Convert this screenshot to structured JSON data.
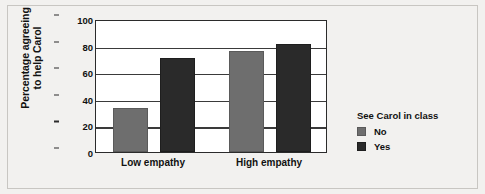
{
  "chart_data": {
    "type": "bar",
    "title": "",
    "subtitle": "",
    "xlabel": "",
    "ylabel": "Percentage agreeing to help Carol",
    "ylabel_lines": [
      "Percentage agreeing",
      "to help Carol"
    ],
    "categories": [
      "Low empathy",
      "High empathy"
    ],
    "series": [
      {
        "name": "No",
        "values": [
          33,
          76
        ],
        "color": "#6e6e6e"
      },
      {
        "name": "Yes",
        "values": [
          71,
          81
        ],
        "color": "#2a2a2a"
      }
    ],
    "ylim": [
      0,
      100
    ],
    "yticks": [
      0,
      20,
      40,
      60,
      80,
      100
    ],
    "ytick_labels": [
      "0",
      "20",
      "40",
      "60",
      "80",
      "100"
    ],
    "grid": true,
    "grid_axis": "y",
    "legend": {
      "title": "See Carol in class",
      "position": "right",
      "entries": [
        {
          "label": "No",
          "color": "#6e6e6e"
        },
        {
          "label": "Yes",
          "color": "#2a2a2a"
        }
      ]
    },
    "background_color": "#f2f1ef",
    "plot_background_color": "#ffffff"
  }
}
